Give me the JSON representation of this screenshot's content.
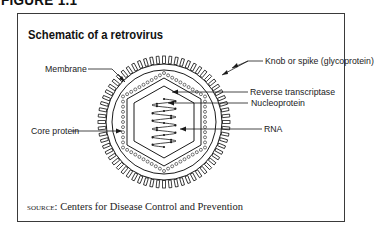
{
  "figure": {
    "heading": "FIGURE 1.1",
    "title": "Schematic of a retrovirus"
  },
  "labels": {
    "membrane": "Membrane",
    "core_protein": "Core protein",
    "knob": "Knob or spike (glycoprotein)",
    "reverse_transcriptase": "Reverse transcriptase",
    "nucleoprotein": "Nucleoprotein",
    "rna": "RNA"
  },
  "source": {
    "prefix": "SOURCE:",
    "text": " Centers for Disease Control and Prevention"
  },
  "colors": {
    "line": "#1a1a1a",
    "frame": "#3a3a3a"
  }
}
